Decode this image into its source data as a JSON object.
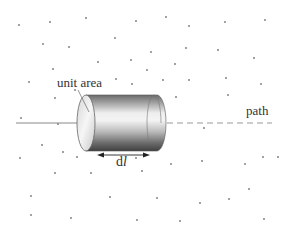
{
  "labels": {
    "unit_area": "unit area",
    "path": "path",
    "dl_prefix": "d",
    "dl_var": "l"
  },
  "colors": {
    "background": "#ffffff",
    "dots": "#777777",
    "line": "#888888",
    "cylinder_dark": "#4a4a4a",
    "cylinder_light": "#e8e8e8"
  },
  "dots": [
    [
      19,
      25
    ],
    [
      50,
      22
    ],
    [
      86,
      18
    ],
    [
      136,
      21
    ],
    [
      166,
      17
    ],
    [
      189,
      26
    ],
    [
      225,
      22
    ],
    [
      265,
      20
    ],
    [
      43,
      44
    ],
    [
      69,
      47
    ],
    [
      115,
      38
    ],
    [
      151,
      52
    ],
    [
      186,
      48
    ],
    [
      218,
      50
    ],
    [
      254,
      58
    ],
    [
      98,
      62
    ],
    [
      131,
      60
    ],
    [
      175,
      64
    ],
    [
      53,
      69
    ],
    [
      147,
      70
    ],
    [
      29,
      82
    ],
    [
      116,
      79
    ],
    [
      132,
      84
    ],
    [
      163,
      80
    ],
    [
      189,
      80
    ],
    [
      226,
      78
    ],
    [
      261,
      84
    ],
    [
      55,
      98
    ],
    [
      75,
      90
    ],
    [
      176,
      97
    ],
    [
      228,
      95
    ],
    [
      21,
      118
    ],
    [
      58,
      124
    ],
    [
      204,
      128
    ],
    [
      42,
      145
    ],
    [
      63,
      152
    ],
    [
      136,
      158
    ],
    [
      278,
      157
    ],
    [
      20,
      158
    ],
    [
      77,
      157
    ],
    [
      171,
      164
    ],
    [
      202,
      161
    ],
    [
      245,
      164
    ],
    [
      263,
      157
    ],
    [
      55,
      173
    ],
    [
      91,
      173
    ],
    [
      142,
      171
    ],
    [
      249,
      189
    ],
    [
      31,
      196
    ],
    [
      110,
      197
    ],
    [
      157,
      198
    ],
    [
      200,
      203
    ],
    [
      229,
      199
    ],
    [
      31,
      215
    ],
    [
      71,
      218
    ],
    [
      137,
      220
    ],
    [
      180,
      221
    ],
    [
      264,
      219
    ]
  ],
  "diagram": {
    "type": "cylinder-along-path",
    "cylinder": {
      "x0": 86,
      "x1": 157,
      "top": 95,
      "bottom": 151,
      "rx": 9
    },
    "path_y": 123,
    "solid_line": {
      "x0": 16,
      "x1": 95
    },
    "dashed_line": {
      "x0": 157,
      "x1": 272
    },
    "arrow": {
      "x0": 97,
      "x1": 150,
      "y": 155
    }
  }
}
